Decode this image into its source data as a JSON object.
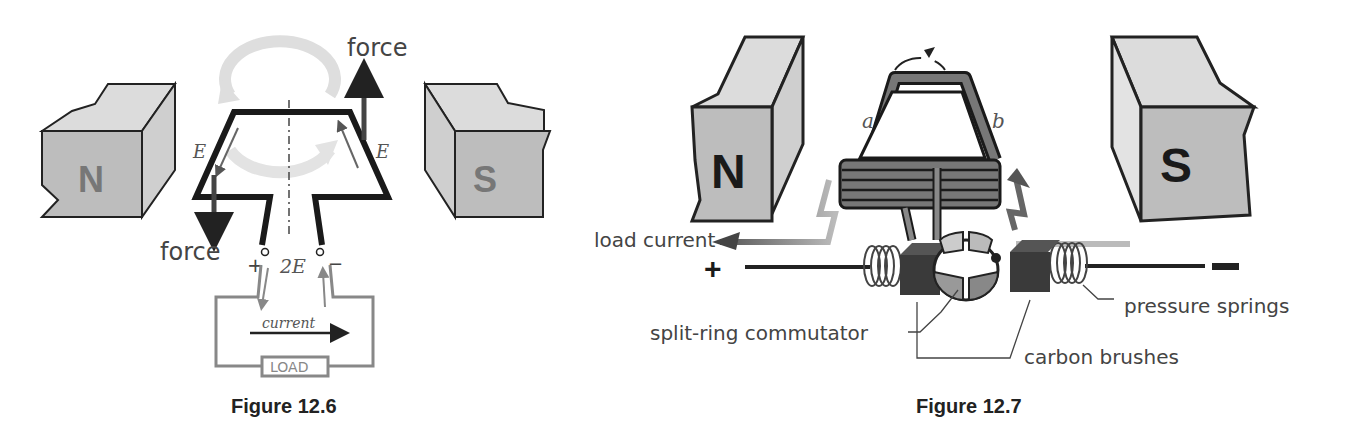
{
  "figures": [
    {
      "caption": "Figure 12.6",
      "magnets": {
        "left": "N",
        "right": "S"
      },
      "labels": {
        "force_top": "force",
        "force_bottom": "force",
        "emf_left": "E",
        "emf_right": "E",
        "terminal_voltage": "2E",
        "plus": "+",
        "minus": "−",
        "current": "current",
        "load": "LOAD"
      }
    },
    {
      "caption": "Figure 12.7",
      "magnets": {
        "left": "N",
        "right": "S"
      },
      "labels": {
        "side_a": "a",
        "side_b": "b",
        "load_current": "load current",
        "plus": "+",
        "minus": "−",
        "split_ring_commutator": "split-ring commutator",
        "carbon_brushes": "carbon brushes",
        "pressure_springs": "pressure springs"
      }
    }
  ],
  "colors": {
    "magnet_face": "#bdbdbd",
    "magnet_top": "#dcdcdc",
    "magnet_side": "#cfcfcf",
    "coil": "#1a1a1a",
    "arrow_dark": "#555555",
    "arrow_light": "#d8d8d8",
    "text": "#444444"
  }
}
